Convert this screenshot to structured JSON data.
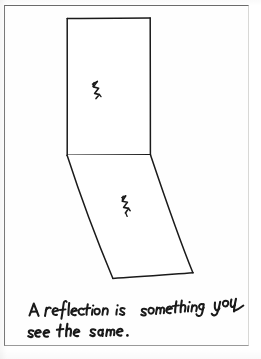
{
  "document": {
    "kind": "handwritten-worksheet-scan",
    "page_background": "#ffffff",
    "border_color": "#6b6b6b",
    "ink_color": "#1a1a1a"
  },
  "drawing": {
    "title": "reflection-diagram",
    "description": "Hand-drawn rectangle reflected into a slanted parallelogram below it",
    "shapes": [
      {
        "name": "upper-rectangle",
        "label": "pre-image",
        "points": "67,18 150,18 150,155 67,155"
      },
      {
        "name": "lower-parallelogram",
        "label": "reflected-image",
        "points": "67,155 150,155 193,273 113,278"
      }
    ],
    "marks": [
      {
        "name": "zigzag-mark-upper",
        "label": "zigzag",
        "x": 97,
        "y": 88
      },
      {
        "name": "zigzag-mark-lower",
        "label": "zigzag-reflected",
        "x": 126,
        "y": 204
      }
    ]
  },
  "handwriting": {
    "full_text": "A reflection is something you see the same.",
    "lines": [
      {
        "name": "handwriting-line-1",
        "text": "A reflection is something you",
        "words": [
          "A",
          "reflection",
          "is",
          "something",
          "you"
        ]
      },
      {
        "name": "handwriting-line-2",
        "text": "see the same.",
        "words": [
          "see",
          "the",
          "same."
        ]
      }
    ]
  }
}
